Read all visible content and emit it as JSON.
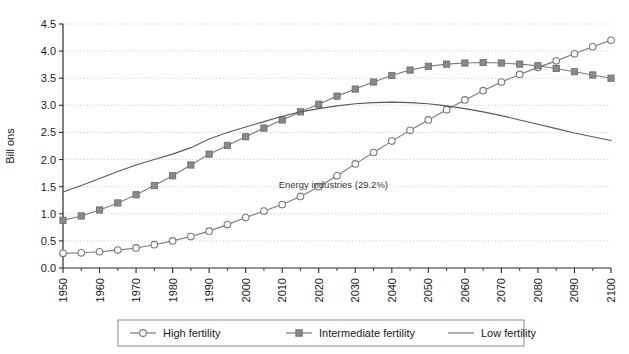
{
  "chart_data": {
    "type": "line",
    "title": "",
    "xlabel": "",
    "ylabel": "Bill ons",
    "xlim": [
      1950,
      2100
    ],
    "ylim": [
      0.0,
      4.5
    ],
    "ytick_step": 0.5,
    "xtick_step": 10,
    "grid": "horizontal-dotted",
    "legend_position": "bottom",
    "yticks": [
      "0.0",
      "0.5",
      "1.0",
      "1.5",
      "2.0",
      "2.5",
      "3.0",
      "3.5",
      "4.0",
      "4.5"
    ],
    "xticks": [
      "1950",
      "1960",
      "1970",
      "1980",
      "1990",
      "2000",
      "2010",
      "2020",
      "2030",
      "2040",
      "2050",
      "2060",
      "2070",
      "2080",
      "2090",
      "2100"
    ],
    "x": [
      1950,
      1955,
      1960,
      1965,
      1970,
      1975,
      1980,
      1985,
      1990,
      1995,
      2000,
      2005,
      2010,
      2015,
      2020,
      2025,
      2030,
      2035,
      2040,
      2045,
      2050,
      2055,
      2060,
      2065,
      2070,
      2075,
      2080,
      2085,
      2090,
      2095,
      2100
    ],
    "series": [
      {
        "name": "High fertility",
        "marker": "circle-open",
        "color": "#7a7a7a",
        "values": [
          0.27,
          0.28,
          0.3,
          0.33,
          0.37,
          0.43,
          0.5,
          0.58,
          0.68,
          0.8,
          0.93,
          1.05,
          1.17,
          1.32,
          1.5,
          1.7,
          1.92,
          2.13,
          2.34,
          2.54,
          2.73,
          2.92,
          3.1,
          3.27,
          3.43,
          3.57,
          3.7,
          3.82,
          3.95,
          4.08,
          4.2
        ]
      },
      {
        "name": "Intermediate fertility",
        "marker": "square-filled",
        "color": "#7a7a7a",
        "values": [
          0.88,
          0.96,
          1.07,
          1.2,
          1.35,
          1.52,
          1.7,
          1.9,
          2.1,
          2.26,
          2.42,
          2.58,
          2.73,
          2.88,
          3.02,
          3.17,
          3.3,
          3.43,
          3.55,
          3.65,
          3.72,
          3.76,
          3.78,
          3.79,
          3.78,
          3.76,
          3.73,
          3.68,
          3.62,
          3.56,
          3.5
        ]
      },
      {
        "name": "Low fertility",
        "marker": "none",
        "color": "#5a5a5a",
        "values": [
          1.4,
          1.52,
          1.65,
          1.78,
          1.9,
          2.0,
          2.1,
          2.22,
          2.38,
          2.5,
          2.6,
          2.7,
          2.8,
          2.88,
          2.94,
          2.99,
          3.03,
          3.05,
          3.06,
          3.05,
          3.03,
          2.99,
          2.94,
          2.88,
          2.81,
          2.73,
          2.65,
          2.57,
          2.49,
          2.42,
          2.35
        ]
      }
    ],
    "annotations": [
      {
        "text": "Energy industries (29.2%)",
        "x": 2024,
        "y": 1.47
      }
    ]
  },
  "legend": {
    "items": [
      {
        "label": "High fertility",
        "marker": "circle-open"
      },
      {
        "label": "Intermediate fertility",
        "marker": "square-filled"
      },
      {
        "label": "Low fertility",
        "marker": "line"
      }
    ]
  },
  "colors": {
    "series_gray": "#7a7a7a",
    "axis": "#2b2b2b",
    "grid": "#c8c8c8",
    "background": "#ffffff"
  }
}
